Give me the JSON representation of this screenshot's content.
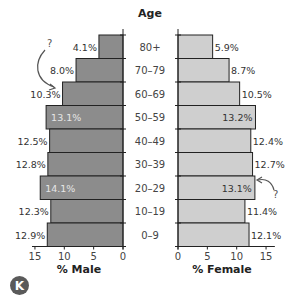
{
  "chart_data": {
    "type": "bar",
    "subtype": "population-pyramid",
    "title": "",
    "center_label": "Age",
    "categories": [
      "80+",
      "70–79",
      "60–69",
      "50–59",
      "40–49",
      "30–39",
      "20–29",
      "10–19",
      "0–9"
    ],
    "series": [
      {
        "name": "% Male",
        "side": "left",
        "color": "#8c8c8c",
        "values": [
          4.1,
          8.0,
          10.3,
          13.1,
          12.5,
          12.8,
          14.1,
          12.3,
          12.9
        ],
        "labels": [
          "4.1%",
          "8.0%",
          "10.3%",
          "13.1%",
          "12.5%",
          "12.8%",
          "14.1%",
          "12.3%",
          "12.9%"
        ]
      },
      {
        "name": "% Female",
        "side": "right",
        "color": "#cfcfcf",
        "values": [
          5.9,
          8.7,
          10.5,
          13.2,
          12.4,
          12.7,
          13.1,
          11.4,
          12.1
        ],
        "labels": [
          "5.9%",
          "8.7%",
          "10.5%",
          "13.2%",
          "12.4%",
          "12.7%",
          "13.1%",
          "11.4%",
          "12.1%"
        ]
      }
    ],
    "male_axis": {
      "label": "% Male",
      "ticks": [
        15,
        10,
        5,
        0
      ],
      "xlim": [
        15,
        0
      ]
    },
    "female_axis": {
      "label": "% Female",
      "ticks": [
        0,
        5,
        10,
        15
      ],
      "xlim": [
        0,
        15
      ]
    },
    "annotations": [
      {
        "text": "?",
        "target": "60–69 male",
        "arrow": "curved"
      },
      {
        "text": "?",
        "target": "20–29 female",
        "arrow": "curved"
      }
    ],
    "grid": false,
    "legend": "none"
  },
  "badge": {
    "label": "K"
  }
}
